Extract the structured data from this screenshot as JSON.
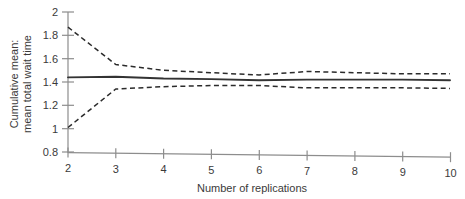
{
  "chart_data": {
    "type": "line",
    "title": "",
    "subtitle": "",
    "xlabel": "Number of replications",
    "ylabel": "Cumulative mean: mean total wait time",
    "ylabel_line1": "Cumulative mean:",
    "ylabel_line2": "mean total wait time",
    "x": [
      2,
      3,
      4,
      5,
      6,
      7,
      8,
      9,
      10
    ],
    "xlim": [
      2,
      10
    ],
    "ylim": [
      0.8,
      2
    ],
    "xticks": [
      "2",
      "3",
      "4",
      "5",
      "6",
      "7",
      "8",
      "9",
      "10"
    ],
    "yticks": [
      "2",
      "1.8",
      "1.6",
      "1.4",
      "1.2",
      "1",
      "0.8"
    ],
    "ytick_values": [
      2,
      1.8,
      1.6,
      1.4,
      1.2,
      1,
      0.8
    ],
    "grid": false,
    "legend": "none",
    "series": [
      {
        "name": "Upper confidence limit",
        "style": "dashed",
        "color": "#2b2b2b",
        "values": [
          1.87,
          1.55,
          1.5,
          1.48,
          1.46,
          1.49,
          1.48,
          1.47,
          1.47
        ]
      },
      {
        "name": "Cumulative mean",
        "style": "solid",
        "color": "#333333",
        "values": [
          1.44,
          1.445,
          1.43,
          1.425,
          1.415,
          1.42,
          1.42,
          1.42,
          1.415
        ]
      },
      {
        "name": "Lower confidence limit",
        "style": "dashed",
        "color": "#2b2b2b",
        "values": [
          1.01,
          1.34,
          1.36,
          1.37,
          1.37,
          1.35,
          1.35,
          1.35,
          1.345
        ]
      }
    ],
    "axis_color": "#8d8d8d",
    "plot_area": {
      "left": 68,
      "right": 450,
      "top": 12,
      "bottom": 152
    }
  }
}
